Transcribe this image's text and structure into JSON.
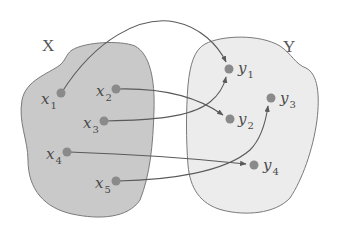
{
  "diagram": {
    "type": "function-mapping",
    "sets": [
      {
        "id": "X",
        "label": "X",
        "fill": "#c9c9c9",
        "stroke": "#7a7a7a"
      },
      {
        "id": "Y",
        "label": "Y",
        "fill": "#ececec",
        "stroke": "#7a7a7a"
      }
    ],
    "domain_points": [
      {
        "id": "x1",
        "name": "x",
        "sub": "1"
      },
      {
        "id": "x2",
        "name": "x",
        "sub": "2"
      },
      {
        "id": "x3",
        "name": "x",
        "sub": "3"
      },
      {
        "id": "x4",
        "name": "x",
        "sub": "4"
      },
      {
        "id": "x5",
        "name": "x",
        "sub": "5"
      }
    ],
    "codomain_points": [
      {
        "id": "y1",
        "name": "y",
        "sub": "1"
      },
      {
        "id": "y2",
        "name": "y",
        "sub": "2"
      },
      {
        "id": "y3",
        "name": "y",
        "sub": "3"
      },
      {
        "id": "y4",
        "name": "y",
        "sub": "4"
      }
    ],
    "mappings": [
      {
        "from": "x1",
        "to": "y1"
      },
      {
        "from": "x2",
        "to": "y2"
      },
      {
        "from": "x3",
        "to": "y1"
      },
      {
        "from": "x4",
        "to": "y4"
      },
      {
        "from": "x5",
        "to": "y3"
      }
    ],
    "colors": {
      "point": "#8a8a8a",
      "arrow": "#5a5a5a",
      "label": "#4a4a4a"
    }
  }
}
